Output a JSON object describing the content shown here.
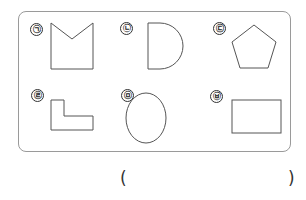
{
  "question": {
    "options": [
      {
        "marker": "㉠",
        "shape": "pentagon-with-notch"
      },
      {
        "marker": "㉡",
        "shape": "semicircle-d-shape"
      },
      {
        "marker": "㉢",
        "shape": "regular-pentagon"
      },
      {
        "marker": "㉣",
        "shape": "l-shape-hexagon"
      },
      {
        "marker": "㉤",
        "shape": "ellipse"
      },
      {
        "marker": "㉥",
        "shape": "rectangle"
      }
    ],
    "answer_open": "(",
    "answer_close": ")",
    "stroke_color": "#555555",
    "border_color": "#9a9a9a"
  }
}
